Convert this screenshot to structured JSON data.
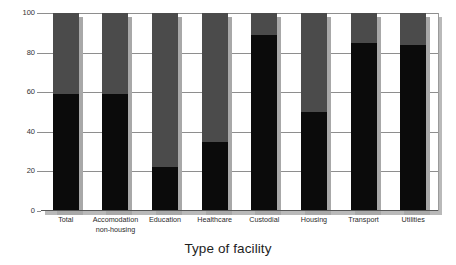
{
  "chart_data": {
    "type": "bar",
    "title": "",
    "subtitle": "",
    "xlabel": "Type of facility",
    "ylabel": "",
    "ylim": [
      0,
      100
    ],
    "yticks": [
      0,
      20,
      40,
      60,
      80,
      100
    ],
    "ytick_labels": [
      "0",
      "20",
      "40",
      "60",
      "80",
      "100"
    ],
    "grid": true,
    "legend": "none",
    "stacked": true,
    "categories": [
      "Total",
      "Accomodation\nnon-housing",
      "Education",
      "Healthcare",
      "Custodial",
      "Housing",
      "Transport",
      "Utilities"
    ],
    "series": [
      {
        "name": "lower-segment",
        "color": "#0b0b0b",
        "values": [
          59,
          59,
          22,
          35,
          89,
          50,
          85,
          84
        ]
      },
      {
        "name": "upper-segment",
        "color": "#4b4b4b",
        "values": [
          41,
          41,
          78,
          65,
          11,
          50,
          15,
          16
        ]
      }
    ],
    "background_column": {
      "name": "reference-100",
      "color": "#d2d2d2",
      "value": 100
    },
    "colors": {
      "lower": "#0b0b0b",
      "upper": "#4b4b4b",
      "background_column": "#d2d2d2",
      "shadow": "#a8a8a8",
      "gridline": "#8e8e8e",
      "axis": "#555555",
      "text": "#2a2a2a"
    }
  }
}
